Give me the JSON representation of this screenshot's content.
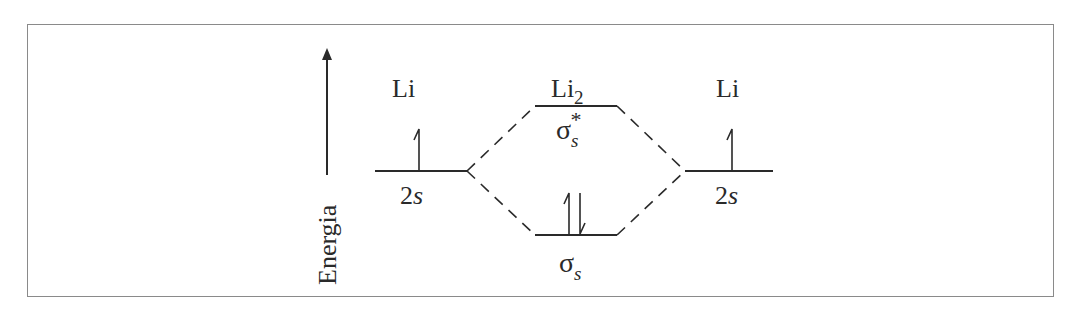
{
  "diagram": {
    "axis_label": "Energia",
    "left_atom": {
      "label": "Li",
      "orbital": "2",
      "orbital_italic": "s",
      "electrons": "up"
    },
    "right_atom": {
      "label": "Li",
      "orbital": "2",
      "orbital_italic": "s",
      "electrons": "up"
    },
    "molecule": {
      "label": "Li",
      "subscript": "2"
    },
    "antibonding": {
      "symbol": "σ",
      "subscript": "s",
      "superscript": "*",
      "electrons": "none"
    },
    "bonding": {
      "symbol": "σ",
      "subscript": "s",
      "electrons": "up-down pair"
    },
    "colors": {
      "line": "#2a2a2a",
      "frame": "#8a8a8a",
      "background": "#ffffff"
    }
  }
}
